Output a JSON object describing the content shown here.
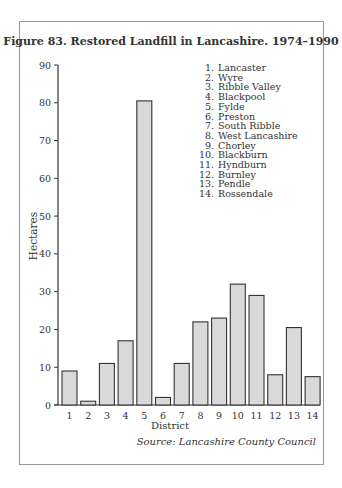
{
  "figure": {
    "title": "Figure 83.  Restored Landfill in Lancashire. 1974–1990",
    "source": "Source: Lancashire County Council"
  },
  "chart_data": {
    "type": "bar",
    "title": "Figure 83. Restored Landfill in Lancashire. 1974–1990",
    "xlabel": "District",
    "ylabel": "Hectares",
    "ylim": [
      0,
      90
    ],
    "yticks": [
      0,
      10,
      20,
      30,
      40,
      50,
      60,
      70,
      80,
      90
    ],
    "grid": false,
    "legend_position": "upper-right",
    "categories": [
      "1",
      "2",
      "3",
      "4",
      "5",
      "6",
      "7",
      "8",
      "9",
      "10",
      "11",
      "12",
      "13",
      "14"
    ],
    "category_names": [
      "Lancaster",
      "Wyre",
      "Ribble Valley",
      "Blackpool",
      "Fylde",
      "Preston",
      "South Ribble",
      "West Lancashire",
      "Chorley",
      "Blackburn",
      "Hyndburn",
      "Burnley",
      "Pendle",
      "Rossendale"
    ],
    "values": [
      9,
      1,
      11,
      17,
      80.5,
      2,
      11,
      22,
      23,
      32,
      29,
      8,
      20.5,
      7.5
    ],
    "bar_color": "#d9d9d9",
    "bar_edge_color": "#333333",
    "source": "Source: Lancashire County Council"
  },
  "legend": [
    {
      "num": "1.",
      "name": "Lancaster"
    },
    {
      "num": "2.",
      "name": "Wyre"
    },
    {
      "num": "3.",
      "name": "Ribble Valley"
    },
    {
      "num": "4.",
      "name": "Blackpool"
    },
    {
      "num": "5.",
      "name": "Fylde"
    },
    {
      "num": "6.",
      "name": "Preston"
    },
    {
      "num": "7.",
      "name": "South Ribble"
    },
    {
      "num": "8.",
      "name": "West Lancashire"
    },
    {
      "num": "9.",
      "name": "Chorley"
    },
    {
      "num": "10.",
      "name": "Blackburn"
    },
    {
      "num": "11.",
      "name": "Hyndburn"
    },
    {
      "num": "12.",
      "name": "Burnley"
    },
    {
      "num": "13.",
      "name": "Pendle"
    },
    {
      "num": "14.",
      "name": "Rossendale"
    }
  ]
}
